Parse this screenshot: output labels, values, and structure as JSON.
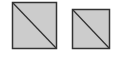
{
  "diagram": {
    "background": "#ffffff",
    "shapes": [
      {
        "id": "square-large",
        "x": 12.5,
        "y": 2.5,
        "w": 44,
        "h": 46,
        "fill": "#cccccc",
        "stroke": "#333333",
        "diagonal": "top-left-to-bottom-right"
      },
      {
        "id": "square-small",
        "x": 72.5,
        "y": 9.5,
        "w": 37,
        "h": 39,
        "fill": "#cccccc",
        "stroke": "#333333",
        "diagonal": "top-left-to-bottom-right"
      }
    ]
  }
}
